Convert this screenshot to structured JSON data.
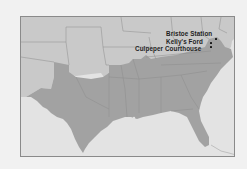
{
  "map": {
    "title": "",
    "region": "Southeastern United States (Confederate states shaded)",
    "colors": {
      "confederate": "#a2a2a2",
      "union": "#c9c9c9",
      "water": "#e3e3e3",
      "border": "#8a8a8a",
      "state_lines": "#8c8c8c",
      "marker": "#111111"
    },
    "markers": [
      {
        "label": "Bristoe Station",
        "x": 195,
        "y": 22
      },
      {
        "label": "Kelly's Ford",
        "x": 190,
        "y": 26
      },
      {
        "label": "Culpeper Courthouse",
        "x": 190,
        "y": 30
      }
    ]
  }
}
